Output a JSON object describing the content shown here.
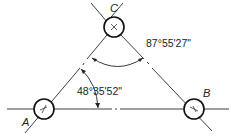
{
  "diagram": {
    "type": "triangulation-angle-diagram",
    "points": [
      {
        "id": "A",
        "label": "A",
        "cx": 44,
        "cy": 109,
        "marker": "slash-cross"
      },
      {
        "id": "B",
        "label": "B",
        "cx": 194,
        "cy": 109,
        "marker": "slash-cross"
      },
      {
        "id": "C",
        "label": "C",
        "cx": 114,
        "cy": 27,
        "marker": "x-cross"
      }
    ],
    "angles": [
      {
        "id": "angle-at-C",
        "value": "87°55'27\"",
        "between": [
          "CA",
          "CB"
        ]
      },
      {
        "id": "angle-at-A",
        "value": "48°35'52\"",
        "between": [
          "AB",
          "AC"
        ]
      }
    ],
    "colors": {
      "line": "#2a2a2a",
      "circle": "#111111",
      "background": "#ffffff"
    }
  }
}
